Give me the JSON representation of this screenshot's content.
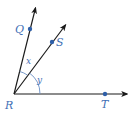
{
  "diagram": {
    "type": "angle-rays",
    "vertex": {
      "label": "R",
      "x": 14,
      "y": 94
    },
    "rays": [
      {
        "name": "RQ",
        "tip": [
          36,
          7
        ],
        "point": {
          "label": "Q",
          "x": 30,
          "y": 29
        }
      },
      {
        "name": "RS",
        "tip": [
          66,
          24
        ],
        "point": {
          "label": "S",
          "x": 52,
          "y": 42
        }
      },
      {
        "name": "RT",
        "tip": [
          128,
          94
        ],
        "point": {
          "label": "T",
          "x": 105,
          "y": 94
        }
      }
    ],
    "angles": [
      {
        "label": "x",
        "between": [
          "RQ",
          "RS"
        ]
      },
      {
        "label": "y",
        "between": [
          "RS",
          "RT"
        ]
      }
    ],
    "colors": {
      "line": "#1a1a1a",
      "point": "#2f5fa8",
      "label": "#3f6fb5",
      "arc": "#6a8fc4"
    }
  }
}
